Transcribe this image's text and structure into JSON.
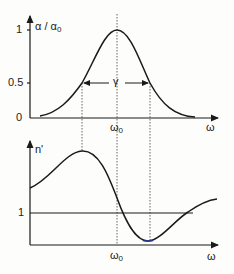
{
  "top_plot": {
    "ylabel": "α / α",
    "ylabel_sub": "0",
    "yticks": [
      "1",
      "0.5",
      "0"
    ],
    "xtick": "ω",
    "xtick_sub": "0",
    "xlabel": "ω",
    "width_label": "γ"
  },
  "bottom_plot": {
    "ylabel": "n'",
    "yticks": [
      "1"
    ],
    "xtick": "ω",
    "xtick_sub": "0",
    "xlabel": "ω"
  },
  "colors": {
    "ink": "#1a1a1a",
    "dotted": "#555555",
    "minimum_accent": "#2a3a8a"
  }
}
